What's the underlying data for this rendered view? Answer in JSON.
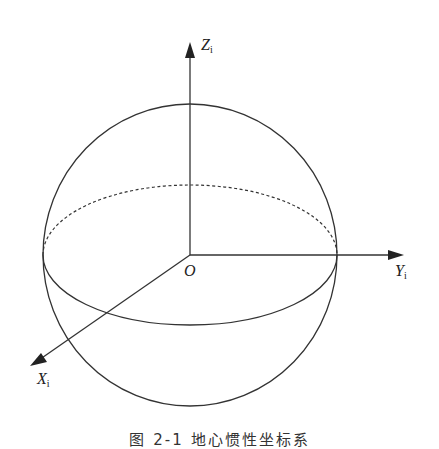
{
  "diagram": {
    "type": "coordinate-system",
    "labels": {
      "z_axis": "Z",
      "z_sub": "i",
      "y_axis": "Y",
      "y_sub": "i",
      "x_axis": "X",
      "x_sub": "i",
      "origin": "O"
    },
    "caption": "图 2-1   地心惯性坐标系"
  }
}
